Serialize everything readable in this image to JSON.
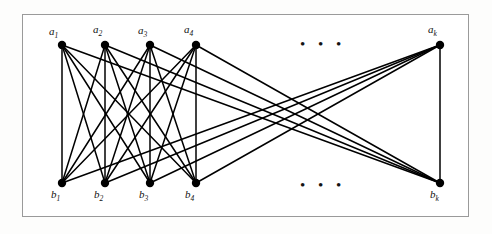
{
  "figure": {
    "kind": "bipartite-graph-diagram",
    "frame": {
      "x": 22,
      "y": 14,
      "width": 447,
      "height": 203,
      "border_color": "#9a9a9a"
    },
    "background_color": "#ffffff",
    "page_background_color": "#fdfdfc",
    "edge_color": "#000000",
    "node_color": "#000000",
    "top_ellipsis": "• • •",
    "bottom_ellipsis": "• • •",
    "top_ellipsis_pos": {
      "x": 300,
      "y": 37
    },
    "bottom_ellipsis_pos": {
      "x": 300,
      "y": 178
    },
    "node_radius": 4.2,
    "edge_width": 1.5,
    "top_nodes": [
      {
        "id": "a1",
        "label": "a",
        "sub": "1",
        "x": 62,
        "y": 45,
        "label_x": 49,
        "label_y": 25
      },
      {
        "id": "a2",
        "label": "a",
        "sub": "2",
        "x": 105,
        "y": 45,
        "label_x": 93,
        "label_y": 23
      },
      {
        "id": "a3",
        "label": "a",
        "sub": "3",
        "x": 150,
        "y": 45,
        "label_x": 138,
        "label_y": 24
      },
      {
        "id": "a4",
        "label": "a",
        "sub": "4",
        "x": 196,
        "y": 45,
        "label_x": 184,
        "label_y": 23
      },
      {
        "id": "ak",
        "label": "a",
        "sub": "k",
        "x": 440,
        "y": 45,
        "label_x": 428,
        "label_y": 23
      }
    ],
    "bottom_nodes": [
      {
        "id": "b1",
        "label": "b",
        "sub": "1",
        "x": 62,
        "y": 183,
        "label_x": 51,
        "label_y": 188
      },
      {
        "id": "b2",
        "label": "b",
        "sub": "2",
        "x": 105,
        "y": 183,
        "label_x": 94,
        "label_y": 188
      },
      {
        "id": "b3",
        "label": "b",
        "sub": "3",
        "x": 150,
        "y": 183,
        "label_x": 139,
        "label_y": 188
      },
      {
        "id": "b4",
        "label": "b",
        "sub": "4",
        "x": 196,
        "y": 183,
        "label_x": 185,
        "label_y": 188
      },
      {
        "id": "bk",
        "label": "b",
        "sub": "k",
        "x": 440,
        "y": 183,
        "label_x": 430,
        "label_y": 188
      }
    ],
    "edges": [
      {
        "from": "a1",
        "to": "b1"
      },
      {
        "from": "a1",
        "to": "b2"
      },
      {
        "from": "a1",
        "to": "b3"
      },
      {
        "from": "a1",
        "to": "b4"
      },
      {
        "from": "a1",
        "to": "bk"
      },
      {
        "from": "a2",
        "to": "b1"
      },
      {
        "from": "a2",
        "to": "b2"
      },
      {
        "from": "a2",
        "to": "b3"
      },
      {
        "from": "a2",
        "to": "b4"
      },
      {
        "from": "a2",
        "to": "bk"
      },
      {
        "from": "a3",
        "to": "b1"
      },
      {
        "from": "a3",
        "to": "b2"
      },
      {
        "from": "a3",
        "to": "b3"
      },
      {
        "from": "a3",
        "to": "b4"
      },
      {
        "from": "a3",
        "to": "bk"
      },
      {
        "from": "a4",
        "to": "b1"
      },
      {
        "from": "a4",
        "to": "b2"
      },
      {
        "from": "a4",
        "to": "b3"
      },
      {
        "from": "a4",
        "to": "b4"
      },
      {
        "from": "a4",
        "to": "bk"
      },
      {
        "from": "ak",
        "to": "b1"
      },
      {
        "from": "ak",
        "to": "b2"
      },
      {
        "from": "ak",
        "to": "b3"
      },
      {
        "from": "ak",
        "to": "b4"
      },
      {
        "from": "ak",
        "to": "bk"
      }
    ]
  }
}
